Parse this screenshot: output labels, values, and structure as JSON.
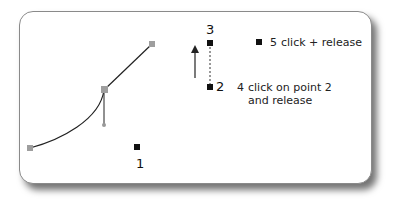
{
  "diagram": {
    "points": {
      "p1": {
        "label": "1"
      },
      "p2": {
        "label": "2"
      },
      "p3": {
        "label": "3"
      }
    },
    "steps": {
      "step4": {
        "number": "4",
        "text_line1": "click on point 2",
        "text_line2": "and release"
      },
      "step5": {
        "number": "5",
        "text": "click + release"
      }
    },
    "colors": {
      "anchor_gray": "#9e9e9e",
      "point_black": "#111111",
      "curve": "#222222"
    }
  }
}
